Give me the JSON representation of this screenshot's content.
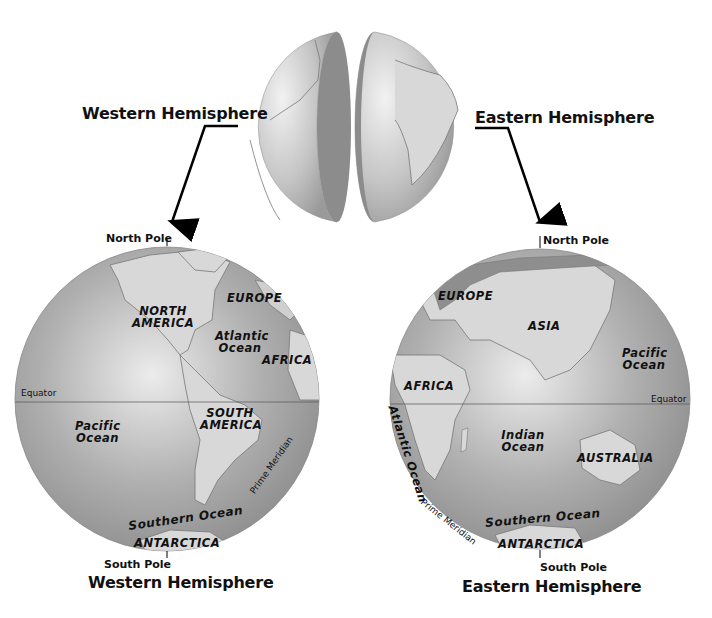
{
  "colors": {
    "ocean": "#9a9a9a",
    "ocean_light": "#e0e0e0",
    "land": "#d6d6d6",
    "land_dark": "#8a8a8a",
    "cut_face": "#8c8c8c",
    "text": "#111111"
  },
  "top_globe": {
    "left_label": "Western Hemisphere",
    "right_label": "Eastern Hemisphere"
  },
  "western": {
    "north_pole": "North Pole",
    "south_pole": "South Pole",
    "equator": "Equator",
    "prime_meridian": "Prime Meridian",
    "caption": "Western Hemisphere",
    "labels": {
      "north_america": "NORTH AMERICA",
      "europe": "EUROPE",
      "atlantic": "Atlantic Ocean",
      "africa": "AFRICA",
      "pacific": "Pacific Ocean",
      "south_america": "SOUTH AMERICA",
      "southern_ocean": "Southern Ocean",
      "antarctica": "ANTARCTICA"
    }
  },
  "eastern": {
    "north_pole": "North Pole",
    "south_pole": "South Pole",
    "equator": "Equator",
    "prime_meridian": "Prime Meridian",
    "caption": "Eastern Hemisphere",
    "labels": {
      "europe": "EUROPE",
      "asia": "ASIA",
      "pacific": "Pacific Ocean",
      "africa": "AFRICA",
      "atlantic": "Atlantic Ocean",
      "indian": "Indian Ocean",
      "australia": "AUSTRALIA",
      "southern_ocean": "Southern Ocean",
      "antarctica": "ANTARCTICA"
    }
  }
}
